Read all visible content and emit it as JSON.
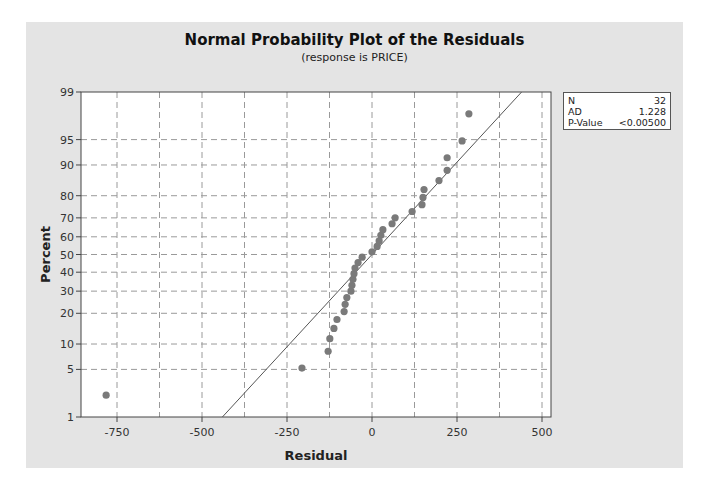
{
  "chart_data": {
    "type": "scatter",
    "title": "Normal Probability Plot of the Residuals",
    "subtitle": "(response is PRICE)",
    "xlabel": "Residual",
    "ylabel": "Percent",
    "xlim": [
      -850,
      525
    ],
    "ylim": [
      1,
      99
    ],
    "x_ticks": [
      -750,
      -500,
      -250,
      0,
      250,
      500
    ],
    "x_grid": [
      -750,
      -625,
      -500,
      -375,
      -250,
      -125,
      0,
      125,
      250,
      375,
      500
    ],
    "y_ticks": [
      1,
      5,
      10,
      20,
      30,
      40,
      50,
      60,
      70,
      80,
      90,
      95,
      99
    ],
    "grid": true,
    "fit_line": {
      "from": [
        -440,
        1
      ],
      "to": [
        440,
        99
      ]
    },
    "points": [
      {
        "residual": -782,
        "percent": 2.2
      },
      {
        "residual": -206,
        "percent": 5.2
      },
      {
        "residual": -129,
        "percent": 8.3
      },
      {
        "residual": -124,
        "percent": 11.4
      },
      {
        "residual": -112,
        "percent": 14.5
      },
      {
        "residual": -103,
        "percent": 17.6
      },
      {
        "residual": -82,
        "percent": 20.7
      },
      {
        "residual": -79,
        "percent": 23.8
      },
      {
        "residual": -74,
        "percent": 26.9
      },
      {
        "residual": -62,
        "percent": 30.0
      },
      {
        "residual": -59,
        "percent": 33.0
      },
      {
        "residual": -56,
        "percent": 36.1
      },
      {
        "residual": -53,
        "percent": 39.2
      },
      {
        "residual": -50,
        "percent": 42.3
      },
      {
        "residual": -41,
        "percent": 45.4
      },
      {
        "residual": -29,
        "percent": 48.5
      },
      {
        "residual": 0,
        "percent": 51.5
      },
      {
        "residual": 15,
        "percent": 54.6
      },
      {
        "residual": 21,
        "percent": 57.7
      },
      {
        "residual": 26,
        "percent": 60.8
      },
      {
        "residual": 32,
        "percent": 63.9
      },
      {
        "residual": 59,
        "percent": 67.0
      },
      {
        "residual": 68,
        "percent": 70.0
      },
      {
        "residual": 118,
        "percent": 73.1
      },
      {
        "residual": 147,
        "percent": 76.2
      },
      {
        "residual": 150,
        "percent": 79.3
      },
      {
        "residual": 153,
        "percent": 82.4
      },
      {
        "residual": 197,
        "percent": 85.5
      },
      {
        "residual": 221,
        "percent": 88.6
      },
      {
        "residual": 221,
        "percent": 91.7
      },
      {
        "residual": 265,
        "percent": 94.8
      },
      {
        "residual": 285,
        "percent": 97.8
      }
    ],
    "stats": [
      {
        "label": "N",
        "value": "32"
      },
      {
        "label": "AD",
        "value": "1.228"
      },
      {
        "label": "P-Value",
        "value": "<0.00500"
      }
    ]
  },
  "colors": {
    "panel_bg": "#e4e4e4",
    "plot_bg": "#ffffff",
    "point": "#7a7a7a",
    "line": "#555555",
    "grid": "#9a9a9a"
  }
}
